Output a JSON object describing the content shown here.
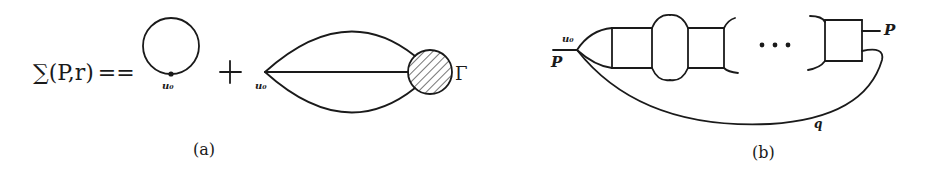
{
  "figure": {
    "panel_a": {
      "lhs": "∑(P,r)",
      "equals": "==",
      "plus": "+",
      "tadpole_vertex_label": "u₀",
      "sunset_vertex_label": "u₀",
      "vertex_function_label": "Γ",
      "caption": "(a)"
    },
    "panel_b": {
      "incoming_momentum": "P",
      "outgoing_momentum": "P",
      "vertex_label": "u₀",
      "loop_momentum": "q",
      "ellipsis": "• • •",
      "caption": "(b)"
    }
  },
  "colors": {
    "ink": "#1a1a1a",
    "background": "#ffffff"
  }
}
